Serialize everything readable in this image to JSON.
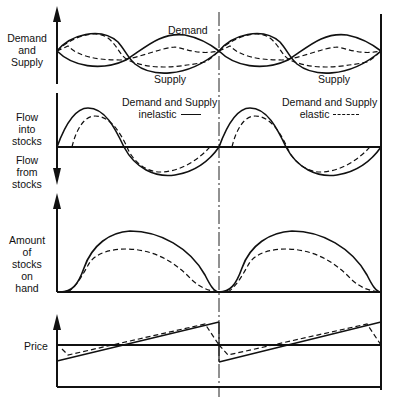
{
  "diagram": {
    "panels": [
      {
        "id": "demand-supply",
        "ylabel": "Demand and Supply",
        "ylabel_lines": [
          "Demand",
          "and",
          "Supply"
        ],
        "curve_labels": {
          "demand": "Demand",
          "supply_left": "Supply",
          "supply_right": "Supply"
        }
      },
      {
        "id": "flow",
        "ylabel_up_lines": [
          "Flow",
          "into",
          "stocks"
        ],
        "ylabel_down_lines": [
          "Flow",
          "from",
          "stocks"
        ]
      },
      {
        "id": "stocks",
        "ylabel_lines": [
          "Amount",
          "of",
          "stocks",
          "on",
          "hand"
        ]
      },
      {
        "id": "price",
        "ylabel": "Price"
      }
    ],
    "legend": {
      "inelastic": {
        "line1": "Demand and Supply",
        "line2": "inelastic",
        "style": "solid"
      },
      "elastic": {
        "line1": "Demand and Supply",
        "line2": "elastic",
        "style": "dashed"
      }
    },
    "colors": {
      "ink": "#111111",
      "background": "#ffffff"
    }
  }
}
